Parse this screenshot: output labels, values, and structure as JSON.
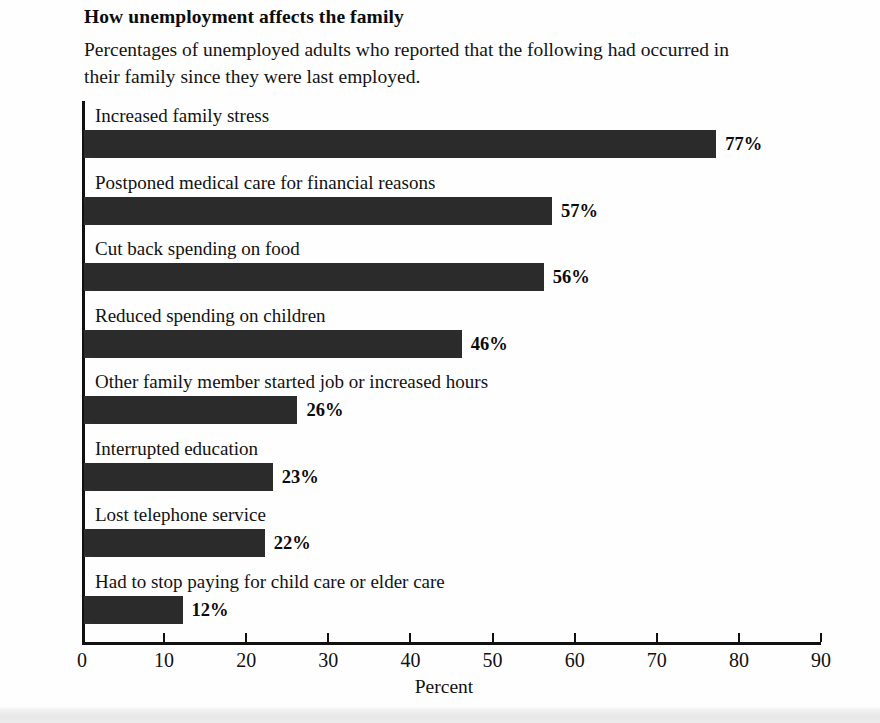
{
  "header": {
    "title": "How unemployment affects the family",
    "subtitle": "Percentages of unemployed adults who reported that the following had occurred in their family since they were last employed."
  },
  "chart_data": {
    "type": "bar",
    "orientation": "horizontal",
    "title": "How unemployment affects the family",
    "subtitle": "Percentages of unemployed adults who reported that the following had occurred in their family since they were last employed.",
    "xlabel": "Percent",
    "ylabel": "",
    "xlim": [
      0,
      90
    ],
    "grid": false,
    "legend": false,
    "bar_color": "#2b2b2b",
    "axis_color": "#111111",
    "tick_values": [
      0,
      10,
      20,
      30,
      40,
      50,
      60,
      70,
      80,
      90
    ],
    "tick_labels": [
      "0",
      "10",
      "20",
      "30",
      "40",
      "50",
      "60",
      "70",
      "80",
      "90"
    ],
    "categories": [
      "Increased family stress",
      "Postponed medical care for financial reasons",
      "Cut back spending on food",
      "Reduced spending on children",
      "Other family member started job or increased hours",
      "Interrupted education",
      "Lost telephone service",
      "Had to stop paying for child care or elder care"
    ],
    "values": [
      77,
      57,
      56,
      46,
      26,
      23,
      22,
      12
    ],
    "value_labels": [
      "77%",
      "57%",
      "56%",
      "46%",
      "26%",
      "23%",
      "22%",
      "12%"
    ]
  }
}
